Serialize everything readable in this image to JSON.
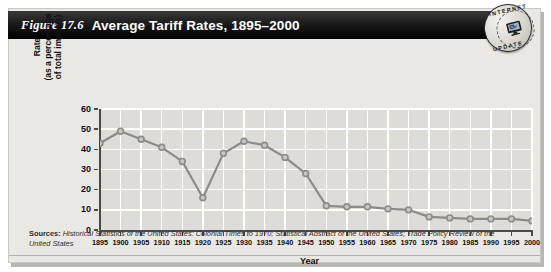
{
  "figure": {
    "number_label": "Figure 17.6",
    "title": "Average Tariff Rates, 1895–2000"
  },
  "badge": {
    "name": "internet-update-seal",
    "word_top": "INTERNET",
    "word_bottom": "UPDATE",
    "icon": "computer-monitor-icon"
  },
  "sources": {
    "prefix": "Sources:",
    "text": " Historical Statistics of the United States: Colonial Times to 1970; Statistical Abstract of the United States; Trade Policy Review of the United States"
  },
  "colors": {
    "title_bar": "#000000",
    "title_text": "#ffffff",
    "plot_background": "#dedcd6",
    "gridline": "#ffffff",
    "line": "#8d8b86",
    "marker_fill": "#c9c7c2",
    "axis": "#4c4a46",
    "card_background": "#e9e8e4"
  },
  "chart_data": {
    "type": "line",
    "title": "Average Tariff Rates, 1895–2000",
    "xlabel": "Year",
    "ylabel": "Rate (as a percentage of total imports)",
    "ylabel_lines": [
      "Rate",
      "(as a percentage",
      "of total imports)"
    ],
    "xlim": [
      1895,
      2000
    ],
    "ylim": [
      0,
      60
    ],
    "yticks": [
      0,
      10,
      20,
      30,
      40,
      50,
      60
    ],
    "xticks": [
      1895,
      1900,
      1905,
      1910,
      1915,
      1920,
      1925,
      1930,
      1935,
      1940,
      1945,
      1950,
      1955,
      1960,
      1965,
      1970,
      1975,
      1980,
      1985,
      1990,
      1995,
      2000
    ],
    "grid": true,
    "legend": null,
    "markers": "circle",
    "series": [
      {
        "name": "Average tariff rate",
        "x": [
          1895,
          1900,
          1905,
          1910,
          1915,
          1920,
          1925,
          1930,
          1935,
          1940,
          1945,
          1950,
          1955,
          1960,
          1965,
          1970,
          1975,
          1980,
          1985,
          1990,
          1995,
          2000
        ],
        "values": [
          43,
          49,
          45,
          41,
          34,
          16,
          38,
          44,
          42,
          36,
          28,
          12,
          11.5,
          11.5,
          10.5,
          10,
          6.5,
          6,
          5.5,
          5.5,
          5.5,
          4.5
        ]
      }
    ]
  }
}
